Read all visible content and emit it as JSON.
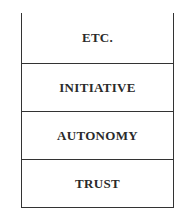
{
  "diagram": {
    "type": "stacked-blocks",
    "levels": [
      {
        "label": "ETC."
      },
      {
        "label": "INITIATIVE"
      },
      {
        "label": "AUTONOMY"
      },
      {
        "label": "TRUST"
      }
    ],
    "colors": {
      "line": "#333333",
      "text": "#2a2a2a",
      "background": "#ffffff"
    }
  }
}
